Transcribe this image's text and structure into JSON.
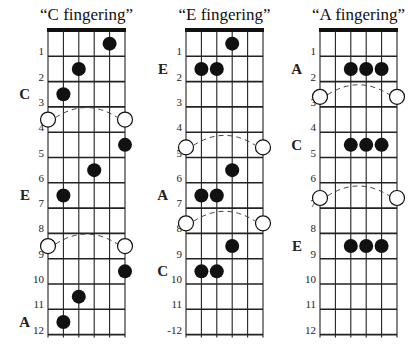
{
  "layout": {
    "nut_y": 31,
    "fret_spacing": 25.3,
    "frets": 12,
    "strings": 6,
    "string_spacing": 15.4,
    "dot_radius": 7,
    "open_circle_radius": 7.5,
    "colors": {
      "ink": "#111111",
      "grid": "#222222",
      "dash": "#444444",
      "background": "#ffffff"
    }
  },
  "diagrams": [
    {
      "id": "c-fingering",
      "title": "“C fingering”",
      "left_x": 48,
      "fret_number_labels": [
        "1",
        "2",
        "3",
        "4",
        "5",
        "6",
        "7",
        "8",
        "9",
        "10",
        "11",
        "12"
      ],
      "dots": [
        {
          "string": 5,
          "fret": 1
        },
        {
          "string": 3,
          "fret": 2
        },
        {
          "string": 2,
          "fret": 3
        },
        {
          "string": 6,
          "fret": 5
        },
        {
          "string": 4,
          "fret": 6
        },
        {
          "string": 2,
          "fret": 7
        },
        {
          "string": 6,
          "fret": 10
        },
        {
          "string": 3,
          "fret": 11
        },
        {
          "string": 2,
          "fret": 12
        }
      ],
      "arcs": [
        {
          "y_fret": 3.5
        },
        {
          "y_fret": 8.5
        }
      ],
      "root_labels": [
        {
          "text": "C",
          "fret": 3
        },
        {
          "text": "E",
          "fret": 7
        },
        {
          "text": "A",
          "fret": 12
        }
      ]
    },
    {
      "id": "e-fingering",
      "title": "“E fingering”",
      "left_x": 186,
      "fret_number_labels": [
        "1",
        "2",
        "3",
        "4",
        "5",
        "6",
        "7",
        "8",
        "9",
        "10",
        "11",
        "-12"
      ],
      "dots": [
        {
          "string": 4,
          "fret": 1
        },
        {
          "string": 2,
          "fret": 2
        },
        {
          "string": 3,
          "fret": 2
        },
        {
          "string": 4,
          "fret": 6
        },
        {
          "string": 2,
          "fret": 7
        },
        {
          "string": 3,
          "fret": 7
        },
        {
          "string": 4,
          "fret": 9
        },
        {
          "string": 2,
          "fret": 10
        },
        {
          "string": 3,
          "fret": 10
        }
      ],
      "arcs": [
        {
          "y_fret": 4.6
        },
        {
          "y_fret": 7.6
        }
      ],
      "root_labels": [
        {
          "text": "E",
          "fret": 2
        },
        {
          "text": "A",
          "fret": 7
        },
        {
          "text": "C",
          "fret": 10
        }
      ]
    },
    {
      "id": "a-fingering",
      "title": "“A fingering”",
      "left_x": 320,
      "fret_number_labels": [
        "1",
        "2",
        "3",
        "4",
        "5",
        "6",
        "7",
        "8",
        "9",
        "10",
        "11",
        "12"
      ],
      "dots": [
        {
          "string": 3,
          "fret": 2
        },
        {
          "string": 4,
          "fret": 2
        },
        {
          "string": 5,
          "fret": 2
        },
        {
          "string": 3,
          "fret": 5
        },
        {
          "string": 4,
          "fret": 5
        },
        {
          "string": 5,
          "fret": 5
        },
        {
          "string": 3,
          "fret": 9
        },
        {
          "string": 4,
          "fret": 9
        },
        {
          "string": 5,
          "fret": 9
        }
      ],
      "arcs": [
        {
          "y_fret": 2.6
        },
        {
          "y_fret": 6.6
        }
      ],
      "root_labels": [
        {
          "text": "A",
          "fret": 2
        },
        {
          "text": "C",
          "fret": 5
        },
        {
          "text": "E",
          "fret": 9
        }
      ]
    }
  ],
  "caption": {
    "text": "(caption text cut off at bottom edge)"
  }
}
